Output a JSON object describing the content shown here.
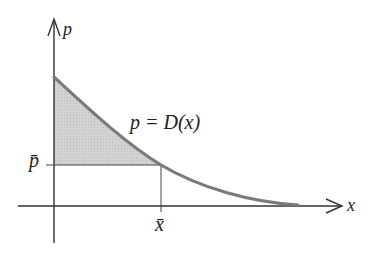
{
  "diagram": {
    "type": "consumer-surplus-demand-curve",
    "axes": {
      "y_label": "p",
      "x_label": "x"
    },
    "curve_label": "p = D(x)",
    "equilibrium": {
      "price_label": "p̄",
      "quantity_label": "x̄"
    },
    "shaded_region": "area between demand curve and price level p̄ from 0 to x̄",
    "colors": {
      "axis": "#333333",
      "curve": "#7a7a7a",
      "shading": "#cfcfcf",
      "guide_lines": "#444444",
      "text": "#222222"
    }
  }
}
